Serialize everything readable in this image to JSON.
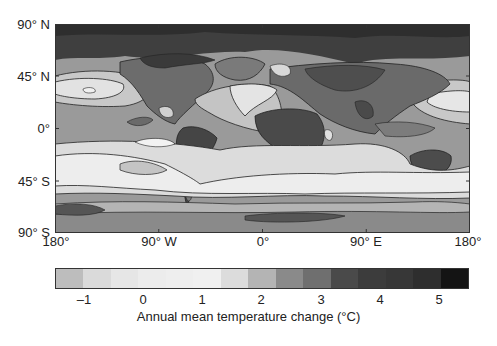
{
  "chart_data": {
    "type": "heatmap",
    "title": "",
    "projection": "equirectangular world map",
    "xlabel": "",
    "ylabel": "",
    "x_ticks": [
      "180°",
      "90° W",
      "0°",
      "90° E",
      "180°"
    ],
    "y_ticks": [
      "90° N",
      "45° N",
      "0°",
      "45° S",
      "90° S"
    ],
    "xlim": [
      -180,
      180
    ],
    "ylim": [
      -90,
      90
    ],
    "colorbar": {
      "label": "Annual mean temperature change (°C)",
      "ticks": [
        "–1",
        "0",
        "1",
        "2",
        "3",
        "4",
        "5"
      ],
      "tick_values": [
        -1,
        0,
        1,
        2,
        3,
        4,
        5
      ],
      "range": [
        -1.5,
        5.5
      ],
      "step": 0.5,
      "colors": [
        "#bdbdbd",
        "#dadada",
        "#e6e6e6",
        "#ececec",
        "#eeeeee",
        "#f0f0f0",
        "#dcdcdc",
        "#b4b4b4",
        "#8a8a8a",
        "#6f6f6f",
        "#4a4a4a",
        "#3c3c3c",
        "#373737",
        "#2e2e2e",
        "#141414"
      ]
    },
    "regions": [
      {
        "name": "Arctic / high northern latitudes",
        "approx_change": 4.5
      },
      {
        "name": "Northern continents (N America, Eurasia)",
        "approx_change": 3.5
      },
      {
        "name": "Africa, Amazon, Australia interior",
        "approx_change": 4.0
      },
      {
        "name": "North Atlantic",
        "approx_change": 0.5
      },
      {
        "name": "North Pacific",
        "approx_change": 1.0
      },
      {
        "name": "Tropical oceans",
        "approx_change": 2.0
      },
      {
        "name": "Southern Ocean (~45–60° S)",
        "approx_change": 0.5
      },
      {
        "name": "Antarctica",
        "approx_change": 3.0
      }
    ],
    "grid": false,
    "legend_position": "bottom"
  },
  "axes": {
    "y_labels": [
      "90° N",
      "45° N",
      "0°",
      "45° S",
      "90° S"
    ],
    "x_labels": [
      "180°",
      "90° W",
      "0°",
      "90° E",
      "180°"
    ]
  },
  "colorbar": {
    "tick_labels": [
      "–1",
      "0",
      "1",
      "2",
      "3",
      "4",
      "5"
    ],
    "title": "Annual mean temperature change (°C)"
  }
}
